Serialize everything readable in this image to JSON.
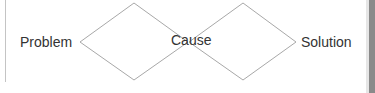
{
  "diagram": {
    "labels": {
      "problem": "Problem",
      "cause": "Cause",
      "solution": "Solution"
    },
    "shapes": [
      {
        "type": "diamond",
        "between": [
          "Problem",
          "Cause"
        ]
      },
      {
        "type": "diamond",
        "between": [
          "Cause",
          "Solution"
        ]
      }
    ],
    "colors": {
      "stroke": "#a8a8a8",
      "text": "#333333",
      "scrollbar": "#8a8a8a"
    }
  }
}
